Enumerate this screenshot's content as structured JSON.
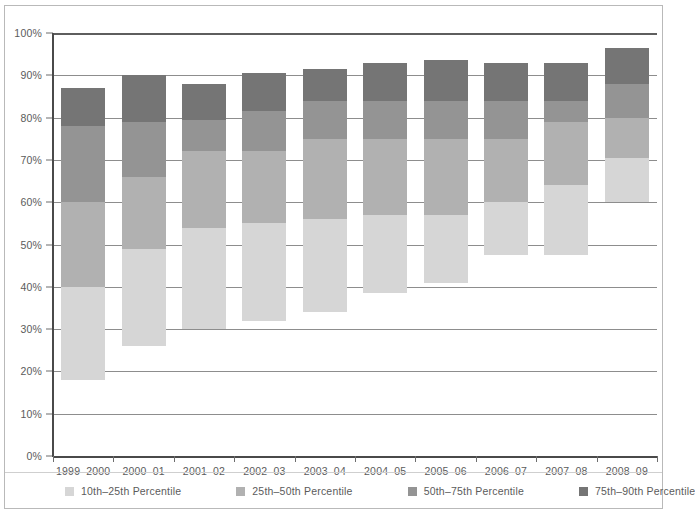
{
  "chart_data": {
    "type": "bar",
    "subtype": "floating-stacked-bar",
    "title": "",
    "xlabel": "",
    "ylabel": "",
    "ylim": [
      0,
      100
    ],
    "y_tick_labels": [
      "0%",
      "10%",
      "20%",
      "30%",
      "40%",
      "50%",
      "60%",
      "70%",
      "80%",
      "90%",
      "100%"
    ],
    "y_tick_values": [
      0,
      10,
      20,
      30,
      40,
      50,
      60,
      70,
      80,
      90,
      100
    ],
    "y_unit": "%",
    "grid": true,
    "legend_position": "bottom",
    "categories": [
      "1999–2000",
      "2000–01",
      "2001–02",
      "2002–03",
      "2003–04",
      "2004–05",
      "2005–06",
      "2006–07",
      "2007–08",
      "2008–09"
    ],
    "series": [
      {
        "name": "10th–25th Percentile",
        "color": "#d6d6d6",
        "bounds": [
          [
            18.0,
            40.0
          ],
          [
            26.0,
            49.0
          ],
          [
            30.0,
            54.0
          ],
          [
            32.0,
            55.0
          ],
          [
            34.0,
            56.0
          ],
          [
            38.5,
            57.0
          ],
          [
            41.0,
            57.0
          ],
          [
            47.5,
            60.0
          ],
          [
            47.5,
            64.0
          ],
          [
            60.0,
            70.5
          ]
        ]
      },
      {
        "name": "25th–50th Percentile",
        "color": "#b1b1b1",
        "bounds": [
          [
            40.0,
            60.0
          ],
          [
            49.0,
            66.0
          ],
          [
            54.0,
            72.0
          ],
          [
            55.0,
            72.0
          ],
          [
            56.0,
            75.0
          ],
          [
            57.0,
            75.0
          ],
          [
            57.0,
            75.0
          ],
          [
            60.0,
            75.0
          ],
          [
            64.0,
            79.0
          ],
          [
            70.5,
            80.0
          ]
        ]
      },
      {
        "name": "50th–75th Percentile",
        "color": "#949494",
        "bounds": [
          [
            60.0,
            78.0
          ],
          [
            66.0,
            79.0
          ],
          [
            72.0,
            79.5
          ],
          [
            72.0,
            81.5
          ],
          [
            75.0,
            84.0
          ],
          [
            75.0,
            84.0
          ],
          [
            75.0,
            84.0
          ],
          [
            75.0,
            84.0
          ],
          [
            79.0,
            84.0
          ],
          [
            80.0,
            88.0
          ]
        ]
      },
      {
        "name": "75th–90th Percentile",
        "color": "#757575",
        "bounds": [
          [
            78.0,
            87.0
          ],
          [
            79.0,
            90.0
          ],
          [
            79.5,
            88.0
          ],
          [
            81.5,
            90.5
          ],
          [
            84.0,
            91.5
          ],
          [
            84.0,
            93.0
          ],
          [
            84.0,
            93.5
          ],
          [
            84.0,
            93.0
          ],
          [
            84.0,
            93.0
          ],
          [
            88.0,
            96.5
          ]
        ]
      }
    ],
    "percentile_values": {
      "p10": [
        18.0,
        26.0,
        30.0,
        32.0,
        34.0,
        38.5,
        41.0,
        47.5,
        47.5,
        60.0
      ],
      "p25": [
        40.0,
        49.0,
        54.0,
        55.0,
        56.0,
        57.0,
        57.0,
        60.0,
        64.0,
        70.5
      ],
      "p50": [
        60.0,
        66.0,
        72.0,
        72.0,
        75.0,
        75.0,
        75.0,
        75.0,
        79.0,
        80.0
      ],
      "p75": [
        78.0,
        79.0,
        79.5,
        81.5,
        84.0,
        84.0,
        84.0,
        84.0,
        84.0,
        88.0
      ],
      "p90": [
        87.0,
        90.0,
        88.0,
        90.5,
        91.5,
        93.0,
        93.5,
        93.0,
        93.0,
        96.5
      ]
    }
  },
  "legend": {
    "items": [
      {
        "label": "10th–25th Percentile",
        "color": "#d6d6d6"
      },
      {
        "label": "25th–50th Percentile",
        "color": "#b1b1b1"
      },
      {
        "label": "50th–75th Percentile",
        "color": "#949494"
      },
      {
        "label": "75th–90th Percentile",
        "color": "#757575"
      }
    ]
  },
  "colors": {
    "grid": "#8d8d8d",
    "axis": "#4a4a4a",
    "text": "#5b5b5b",
    "frame": "#b9b9b9",
    "background": "#ffffff"
  }
}
